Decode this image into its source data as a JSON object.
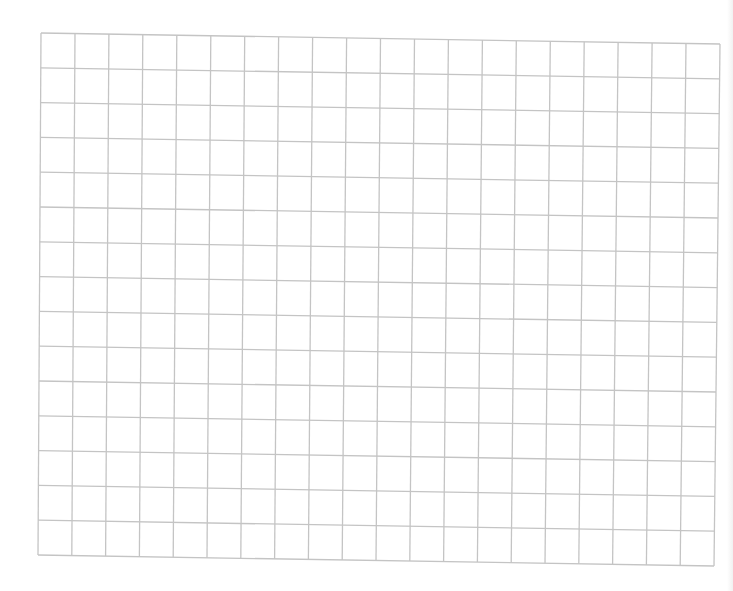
{
  "sheet": {
    "type": "graph-paper",
    "columns": 20,
    "rows": 15,
    "line_color": "#c4c4c4",
    "background_color": "#ffffff",
    "corners": {
      "top_left": [
        41,
        33
      ],
      "top_right": [
        720,
        44
      ],
      "bottom_left": [
        38,
        555
      ],
      "bottom_right": [
        714,
        566
      ]
    }
  }
}
